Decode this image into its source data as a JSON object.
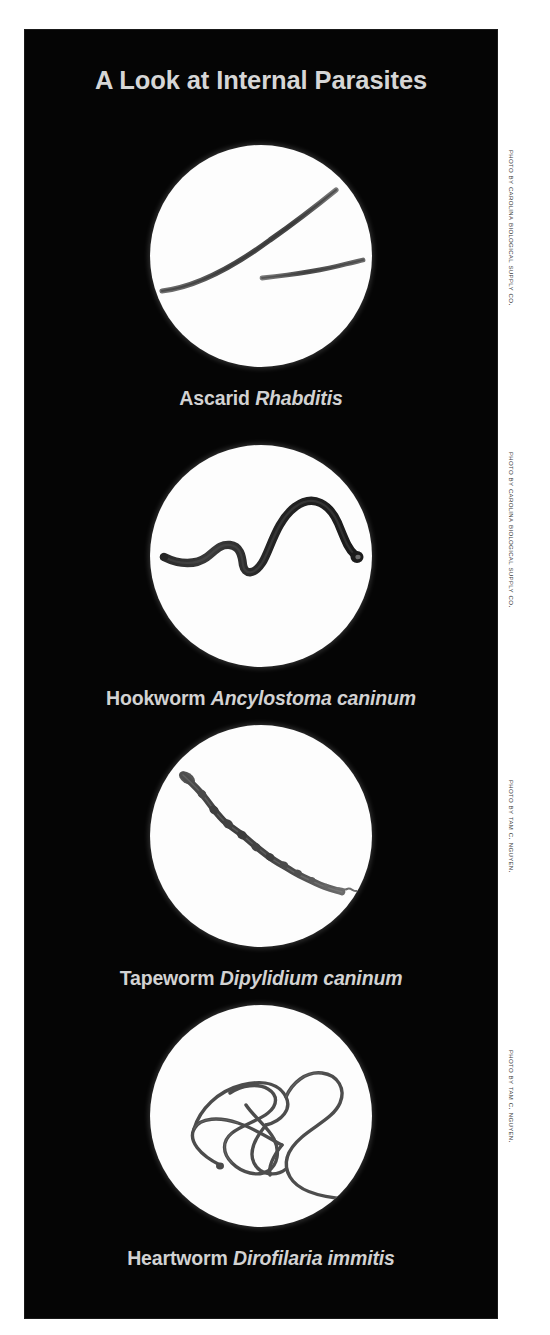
{
  "poster": {
    "title": "A Look at Internal Parasites",
    "background_color": "#050505",
    "text_color": "#d2d2d2",
    "page_background": "#ffffff"
  },
  "specimens": [
    {
      "id": "ascarid",
      "common_name": "Ascarid",
      "scientific_name": "Rhabditis",
      "photo_credit": "Photo by Carolina Biological Supply Co.",
      "image_description": "Two slender dark nematode worms on a bright white microscope field"
    },
    {
      "id": "hookworm",
      "common_name": "Hookworm",
      "scientific_name": "Ancylostoma caninum",
      "photo_credit": "Photo by Carolina Biological Supply Co.",
      "image_description": "A single thick S-curved dark hookworm with a hooked anterior end"
    },
    {
      "id": "tapeworm",
      "common_name": "Tapeworm",
      "scientific_name": "Dipylidium caninum",
      "photo_credit": "Photo by Tam C. Nguyen.",
      "image_description": "A long segmented tapeworm strobila running diagonally across the field"
    },
    {
      "id": "heartworm",
      "common_name": "Heartworm",
      "scientific_name": "Dirofilaria immitis",
      "photo_credit": "Photo by Tam C. Nguyen.",
      "image_description": "A long thin heartworm coiled into overlapping tangled loops"
    }
  ]
}
